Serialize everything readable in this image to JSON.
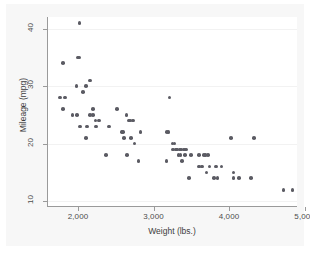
{
  "chart_data": {
    "type": "scatter",
    "title": "",
    "xlabel": "Weight (lbs.)",
    "ylabel": "Mileage (mpg)",
    "xlim": [
      1590,
      4900
    ],
    "ylim": [
      9,
      42
    ],
    "xticks": [
      2000,
      3000,
      4000,
      5000
    ],
    "xtick_labels": [
      "2,000",
      "3,000",
      "4,000",
      "5,000"
    ],
    "yticks": [
      10,
      20,
      30,
      40
    ],
    "ytick_labels": [
      "10",
      "20",
      "30",
      "40"
    ],
    "grid": "horizontal",
    "legend": "none",
    "marker": {
      "shape": "circle",
      "color": "#5b5b63",
      "size": 3.6
    },
    "points": [
      {
        "x": 1760,
        "y": 28
      },
      {
        "x": 1800,
        "y": 34
      },
      {
        "x": 1800,
        "y": 26
      },
      {
        "x": 1830,
        "y": 28
      },
      {
        "x": 1930,
        "y": 25
      },
      {
        "x": 1980,
        "y": 30
      },
      {
        "x": 1990,
        "y": 25
      },
      {
        "x": 2000,
        "y": 35
      },
      {
        "x": 2020,
        "y": 35
      },
      {
        "x": 2020,
        "y": 41
      },
      {
        "x": 2030,
        "y": 23
      },
      {
        "x": 2070,
        "y": 29
      },
      {
        "x": 2110,
        "y": 30
      },
      {
        "x": 2110,
        "y": 21
      },
      {
        "x": 2120,
        "y": 23
      },
      {
        "x": 2160,
        "y": 31
      },
      {
        "x": 2160,
        "y": 25
      },
      {
        "x": 2200,
        "y": 26
      },
      {
        "x": 2200,
        "y": 25
      },
      {
        "x": 2230,
        "y": 24
      },
      {
        "x": 2240,
        "y": 23
      },
      {
        "x": 2280,
        "y": 24
      },
      {
        "x": 2370,
        "y": 18
      },
      {
        "x": 2410,
        "y": 23
      },
      {
        "x": 2520,
        "y": 26
      },
      {
        "x": 2580,
        "y": 22
      },
      {
        "x": 2600,
        "y": 22
      },
      {
        "x": 2610,
        "y": 21
      },
      {
        "x": 2640,
        "y": 25
      },
      {
        "x": 2650,
        "y": 18
      },
      {
        "x": 2670,
        "y": 24
      },
      {
        "x": 2690,
        "y": 24
      },
      {
        "x": 2700,
        "y": 21
      },
      {
        "x": 2730,
        "y": 24
      },
      {
        "x": 2750,
        "y": 20
      },
      {
        "x": 2800,
        "y": 17
      },
      {
        "x": 2830,
        "y": 22
      },
      {
        "x": 3170,
        "y": 17
      },
      {
        "x": 3180,
        "y": 22
      },
      {
        "x": 3200,
        "y": 22
      },
      {
        "x": 3210,
        "y": 28
      },
      {
        "x": 3250,
        "y": 20
      },
      {
        "x": 3260,
        "y": 19
      },
      {
        "x": 3280,
        "y": 20
      },
      {
        "x": 3300,
        "y": 19
      },
      {
        "x": 3310,
        "y": 19
      },
      {
        "x": 3330,
        "y": 18
      },
      {
        "x": 3350,
        "y": 19
      },
      {
        "x": 3360,
        "y": 18
      },
      {
        "x": 3370,
        "y": 19
      },
      {
        "x": 3380,
        "y": 17
      },
      {
        "x": 3400,
        "y": 19
      },
      {
        "x": 3420,
        "y": 18
      },
      {
        "x": 3430,
        "y": 19
      },
      {
        "x": 3470,
        "y": 14
      },
      {
        "x": 3500,
        "y": 18
      },
      {
        "x": 3600,
        "y": 16
      },
      {
        "x": 3600,
        "y": 18
      },
      {
        "x": 3640,
        "y": 16
      },
      {
        "x": 3670,
        "y": 18
      },
      {
        "x": 3690,
        "y": 18
      },
      {
        "x": 3700,
        "y": 15
      },
      {
        "x": 3720,
        "y": 18
      },
      {
        "x": 3740,
        "y": 16
      },
      {
        "x": 3800,
        "y": 14
      },
      {
        "x": 3830,
        "y": 16
      },
      {
        "x": 3850,
        "y": 14
      },
      {
        "x": 3900,
        "y": 16
      },
      {
        "x": 4030,
        "y": 21
      },
      {
        "x": 4060,
        "y": 15
      },
      {
        "x": 4060,
        "y": 14
      },
      {
        "x": 4130,
        "y": 14
      },
      {
        "x": 4290,
        "y": 14
      },
      {
        "x": 4330,
        "y": 21
      },
      {
        "x": 4720,
        "y": 12
      },
      {
        "x": 4840,
        "y": 12
      }
    ]
  },
  "colors": {
    "marker": "#5b5b63",
    "axis": "#9a9a9a",
    "grid": "#f2f2f2",
    "plot_background": "#ffffff",
    "graph_background": "#f7f7f7",
    "tick_text": "#4d4d4d",
    "title_text": "#3d3d3d"
  }
}
